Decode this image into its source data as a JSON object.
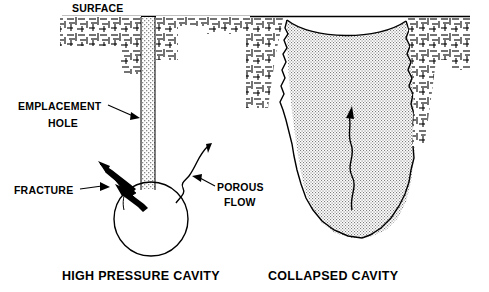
{
  "figure": {
    "type": "geological-cross-section-diagram",
    "background_color": "#ffffff",
    "ink_color": "#000000"
  },
  "labels": {
    "surface": "SURFACE",
    "emplacement_hole_line1": "EMPLACEMENT",
    "emplacement_hole_line2": "HOLE",
    "fracture": "FRACTURE",
    "porous_flow_line1": "POROUS",
    "porous_flow_line2": "FLOW"
  },
  "captions": {
    "left": "HIGH PRESSURE CAVITY",
    "right": "COLLAPSED CAVITY"
  },
  "icons": {
    "fracture_arrow_upper": "arrow-up-left-icon",
    "fracture_arrow_lower": "arrow-up-left-icon",
    "porous_flow_arrow": "arrow-up-icon",
    "chimney_flow_arrow": "arrow-up-icon",
    "emplacement_leader_arrow": "arrow-right-icon",
    "fracture_leader_arrow": "arrow-right-icon",
    "porous_leader_arrow": "arrow-left-icon"
  },
  "panels": {
    "left_panel_name": "high-pressure-cavity-panel",
    "right_panel_name": "collapsed-cavity-panel"
  }
}
